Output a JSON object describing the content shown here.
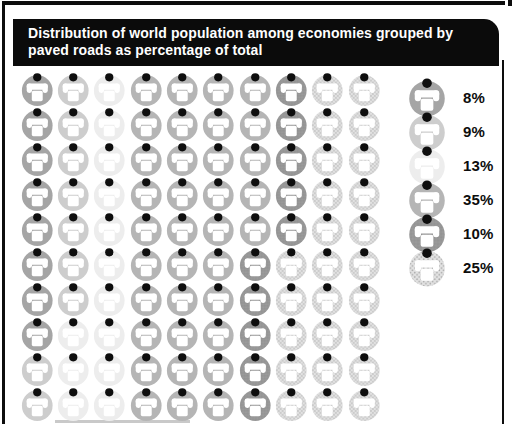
{
  "header": {
    "title": "Distribution of world population among economies grouped by paved roads as percentage of total"
  },
  "chart_data": {
    "type": "pictogram-waffle",
    "title": "Distribution of world population among economies grouped by paved roads as percentage of total",
    "unit_icon": "telephone-icon",
    "units_total": 100,
    "unit_value_percent": 1,
    "grid": {
      "rows": 10,
      "cols": 10,
      "fill_order": "column-major-top-to-bottom-left-to-right"
    },
    "legend_position": "right",
    "series": [
      {
        "label": "8%",
        "value": 8,
        "color": "#a5a5a5",
        "texture": "solid"
      },
      {
        "label": "9%",
        "value": 9,
        "color": "#cdcdcd",
        "texture": "solid"
      },
      {
        "label": "13%",
        "value": 13,
        "color": "#ededed",
        "texture": "solid"
      },
      {
        "label": "35%",
        "value": 35,
        "color": "#b5b5b5",
        "texture": "solid"
      },
      {
        "label": "10%",
        "value": 10,
        "color": "#939393",
        "texture": "stipple-fine"
      },
      {
        "label": "25%",
        "value": 25,
        "color": "#e2e2e2",
        "texture": "stipple"
      }
    ],
    "icon_colors": {
      "head_dot": "#0e0e0e",
      "phone_glyph": "#ffffff",
      "stipple_dot": "#a9a9a9"
    },
    "frame_color": "#0d0d0d",
    "header_bg": "#0b0b0b",
    "header_text_color": "#ffffff"
  }
}
